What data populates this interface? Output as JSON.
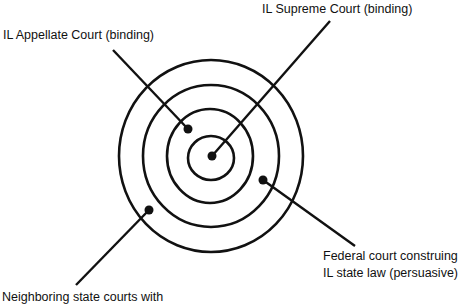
{
  "diagram": {
    "type": "concentric-circles",
    "colors": {
      "background": "#ffffff",
      "stroke": "#111111"
    },
    "center": {
      "x": 211,
      "y": 157
    },
    "rings": [
      {
        "name": "inner",
        "rx": 23,
        "ry": 22
      },
      {
        "name": "third",
        "rx": 43,
        "ry": 47
      },
      {
        "name": "second",
        "rx": 68,
        "ry": 71
      },
      {
        "name": "outer",
        "rx": 92,
        "ry": 96
      }
    ],
    "labels": [
      {
        "id": "supreme",
        "lines": [
          "IL Supreme Court (binding)"
        ],
        "dot": {
          "x": 212,
          "y": 156
        },
        "leader_start": {
          "x": 330,
          "y": 21
        }
      },
      {
        "id": "appellate",
        "lines": [
          "IL Appellate Court (binding)"
        ],
        "dot": {
          "x": 188,
          "y": 129
        },
        "leader_start": {
          "x": 113,
          "y": 50
        }
      },
      {
        "id": "federal",
        "lines": [
          "Federal court construing",
          "IL state law (persuasive)"
        ],
        "dot": {
          "x": 263,
          "y": 180
        },
        "leader_start": {
          "x": 355,
          "y": 246
        }
      },
      {
        "id": "neighboring",
        "lines": [
          "Neighboring state courts with"
        ],
        "dot": {
          "x": 149,
          "y": 210
        },
        "leader_start": {
          "x": 76,
          "y": 285
        }
      }
    ]
  }
}
